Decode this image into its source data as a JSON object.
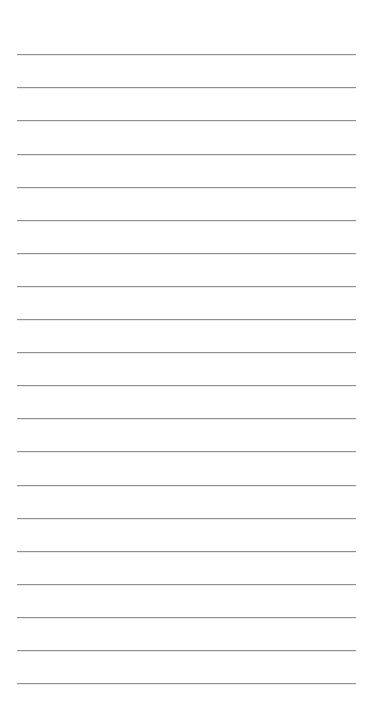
{
  "document": {
    "kind": "ruled-note-sheet",
    "title": "",
    "body_text": "",
    "background_color": "#ffffff",
    "width_px": 373,
    "height_px": 709
  },
  "ruling": {
    "line_color": "#8d8f91",
    "line_thickness_px": 1,
    "line_count": 20,
    "left_x_px": 17,
    "right_x_px": 356,
    "line_length_px": 339,
    "first_line_y_px": 54,
    "last_line_y_px": 683,
    "line_spacing_px": 33.1,
    "top_margin_px": 54,
    "bottom_margin_px": 26,
    "lines": [
      {
        "index": 1,
        "y": 54
      },
      {
        "index": 2,
        "y": 87
      },
      {
        "index": 3,
        "y": 120
      },
      {
        "index": 4,
        "y": 154
      },
      {
        "index": 5,
        "y": 187
      },
      {
        "index": 6,
        "y": 220
      },
      {
        "index": 7,
        "y": 253
      },
      {
        "index": 8,
        "y": 286
      },
      {
        "index": 9,
        "y": 319
      },
      {
        "index": 10,
        "y": 352
      },
      {
        "index": 11,
        "y": 385
      },
      {
        "index": 12,
        "y": 418
      },
      {
        "index": 13,
        "y": 451
      },
      {
        "index": 14,
        "y": 485
      },
      {
        "index": 15,
        "y": 518
      },
      {
        "index": 16,
        "y": 551
      },
      {
        "index": 17,
        "y": 584
      },
      {
        "index": 18,
        "y": 617
      },
      {
        "index": 19,
        "y": 650
      },
      {
        "index": 20,
        "y": 683
      }
    ]
  }
}
